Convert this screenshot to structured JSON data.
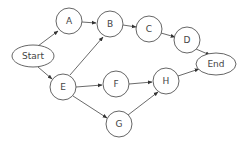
{
  "diagram": {
    "type": "directed-graph",
    "nodes": [
      {
        "id": "Start",
        "label": "Start",
        "shape": "ellipse"
      },
      {
        "id": "A",
        "label": "A",
        "shape": "circle"
      },
      {
        "id": "B",
        "label": "B",
        "shape": "circle"
      },
      {
        "id": "C",
        "label": "C",
        "shape": "circle"
      },
      {
        "id": "D",
        "label": "D",
        "shape": "circle"
      },
      {
        "id": "E",
        "label": "E",
        "shape": "circle"
      },
      {
        "id": "F",
        "label": "F",
        "shape": "circle"
      },
      {
        "id": "G",
        "label": "G",
        "shape": "circle"
      },
      {
        "id": "H",
        "label": "H",
        "shape": "circle"
      },
      {
        "id": "End",
        "label": "End",
        "shape": "ellipse"
      }
    ],
    "edges": [
      {
        "from": "Start",
        "to": "A"
      },
      {
        "from": "Start",
        "to": "E"
      },
      {
        "from": "A",
        "to": "B"
      },
      {
        "from": "E",
        "to": "B"
      },
      {
        "from": "B",
        "to": "C"
      },
      {
        "from": "C",
        "to": "D"
      },
      {
        "from": "D",
        "to": "End"
      },
      {
        "from": "E",
        "to": "F"
      },
      {
        "from": "E",
        "to": "G"
      },
      {
        "from": "F",
        "to": "H"
      },
      {
        "from": "G",
        "to": "H"
      },
      {
        "from": "H",
        "to": "End"
      }
    ]
  },
  "labels": {
    "start": "Start",
    "a": "A",
    "b": "B",
    "c": "C",
    "d": "D",
    "e": "E",
    "f": "F",
    "g": "G",
    "h": "H",
    "end": "End"
  }
}
